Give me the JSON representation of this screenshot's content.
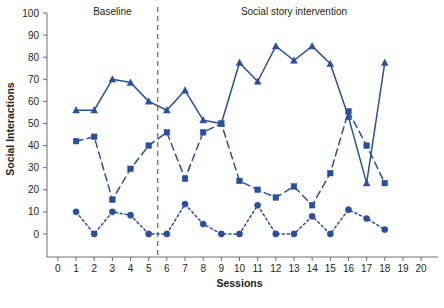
{
  "chart_data": {
    "type": "line",
    "title": "",
    "xlabel": "Sessions",
    "ylabel": "Social Interactions",
    "xlim": [
      -0.6,
      20.6
    ],
    "ylim": [
      -5,
      100
    ],
    "xticks": [
      0,
      1,
      2,
      3,
      4,
      5,
      6,
      7,
      8,
      9,
      10,
      11,
      12,
      13,
      14,
      15,
      16,
      17,
      18,
      19,
      20
    ],
    "yticks": [
      0,
      10,
      20,
      30,
      40,
      50,
      60,
      70,
      80,
      90,
      100
    ],
    "grid": false,
    "legend_position": "none",
    "accent_color": "#2b4f9c",
    "text_color": "#231f20",
    "axis_color": "#6d6e71",
    "phase_divider_x": 5.5,
    "phases": [
      {
        "label": "Baseline",
        "x_center": 3.0
      },
      {
        "label": "Social story intervention",
        "x_center": 13.0
      }
    ],
    "series": [
      {
        "name": "participant-1",
        "marker": "triangle",
        "line_style": "solid",
        "color": "#2b4f9c",
        "x": [
          1,
          2,
          3,
          4,
          5,
          6,
          7,
          8,
          9,
          10,
          11,
          12,
          13,
          14,
          15,
          16,
          17,
          18
        ],
        "values": [
          56,
          56,
          70,
          68.5,
          60,
          56,
          65,
          51.5,
          50,
          77.5,
          69,
          85,
          78.5,
          85,
          77,
          53,
          23,
          77.5
        ]
      },
      {
        "name": "participant-2",
        "marker": "square",
        "line_style": "dashed",
        "color": "#2b4f9c",
        "x": [
          1,
          2,
          3,
          4,
          5,
          6,
          7,
          8,
          9,
          10,
          11,
          12,
          13,
          14,
          15,
          16,
          17,
          18
        ],
        "values": [
          42,
          44,
          15.5,
          29.5,
          40,
          46,
          25,
          46,
          50,
          24,
          20,
          16.5,
          21.5,
          13,
          27.5,
          55.5,
          40,
          23
        ]
      },
      {
        "name": "participant-3",
        "marker": "circle",
        "line_style": "dotted",
        "color": "#2b4f9c",
        "x": [
          1,
          2,
          3,
          4,
          5,
          6,
          7,
          8,
          9,
          10,
          11,
          12,
          13,
          14,
          15,
          16,
          17,
          18
        ],
        "values": [
          10,
          0,
          10,
          8.5,
          0,
          0,
          13.5,
          4.5,
          0,
          0,
          13,
          0,
          0,
          8,
          0,
          11,
          7,
          2
        ]
      }
    ]
  }
}
